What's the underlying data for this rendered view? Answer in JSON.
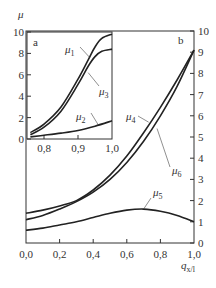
{
  "chart_data": [
    {
      "id": "b",
      "type": "line",
      "panel_label": "b",
      "xlabel": "q_{x/l}",
      "xlabel_main": "q",
      "xlabel_sub": "x/l",
      "ylabel": "",
      "xlim": [
        0.0,
        1.0
      ],
      "ylim": [
        0,
        10
      ],
      "x_ticks": [
        0.0,
        0.2,
        0.4,
        0.6,
        0.8,
        1.0
      ],
      "x_tick_labels": [
        "0,0",
        "0,2",
        "0,4",
        "0,6",
        "0,8",
        "1,0"
      ],
      "y_ticks": [
        0,
        1,
        2,
        3,
        4,
        5,
        6,
        7,
        8,
        9,
        10
      ],
      "y_tick_labels": [
        "0",
        "1",
        "2",
        "3",
        "4",
        "5",
        "6",
        "7",
        "8",
        "9",
        "10"
      ],
      "y_axis_side": "right",
      "series": [
        {
          "name": "μ4",
          "label_main": "μ",
          "label_sub": "4",
          "x": [
            0.0,
            0.1,
            0.2,
            0.3,
            0.4,
            0.5,
            0.6,
            0.7,
            0.8,
            0.9,
            1.0
          ],
          "y": [
            1.4,
            1.55,
            1.75,
            2.0,
            2.5,
            3.2,
            4.1,
            5.2,
            6.4,
            7.7,
            9.1
          ]
        },
        {
          "name": "μ6",
          "label_main": "μ",
          "label_sub": "6",
          "x": [
            0.0,
            0.1,
            0.2,
            0.3,
            0.4,
            0.5,
            0.6,
            0.7,
            0.8,
            0.9,
            1.0
          ],
          "y": [
            1.1,
            1.3,
            1.6,
            1.95,
            2.4,
            3.0,
            3.8,
            4.8,
            6.0,
            7.4,
            9.1
          ]
        },
        {
          "name": "μ5",
          "label_main": "μ",
          "label_sub": "5",
          "x": [
            0.0,
            0.1,
            0.2,
            0.3,
            0.4,
            0.5,
            0.6,
            0.7,
            0.8,
            0.9,
            1.0
          ],
          "y": [
            0.6,
            0.7,
            0.85,
            1.0,
            1.2,
            1.4,
            1.55,
            1.6,
            1.5,
            1.3,
            1.0
          ]
        }
      ]
    },
    {
      "id": "a",
      "type": "line",
      "panel_label": "a",
      "xlabel": "",
      "ylabel": "μ",
      "xlim": [
        0.75,
        1.0
      ],
      "ylim": [
        0,
        10
      ],
      "x_ticks": [
        0.8,
        0.9,
        1.0
      ],
      "x_tick_labels": [
        "0,8",
        "0,9",
        "1,0"
      ],
      "y_ticks": [
        0,
        2,
        4,
        6,
        8,
        10
      ],
      "y_tick_labels": [
        "0",
        "2",
        "4",
        "6",
        "8",
        "10"
      ],
      "y_axis_side": "left",
      "series": [
        {
          "name": "μ1",
          "label_main": "μ",
          "label_sub": "1",
          "x": [
            0.76,
            0.8,
            0.85,
            0.9,
            0.93,
            0.95,
            0.97,
            1.0
          ],
          "y": [
            0.6,
            1.4,
            3.0,
            5.6,
            7.4,
            8.6,
            9.4,
            9.8
          ]
        },
        {
          "name": "μ3",
          "label_main": "μ",
          "label_sub": "3",
          "x": [
            0.76,
            0.8,
            0.85,
            0.9,
            0.93,
            0.95,
            0.97,
            1.0
          ],
          "y": [
            0.4,
            1.1,
            2.6,
            5.1,
            6.8,
            7.7,
            8.2,
            8.4
          ]
        },
        {
          "name": "μ2",
          "label_main": "μ",
          "label_sub": "2",
          "x": [
            0.76,
            0.8,
            0.85,
            0.9,
            0.95,
            1.0
          ],
          "y": [
            0.2,
            0.35,
            0.55,
            0.8,
            1.2,
            1.7
          ]
        }
      ]
    }
  ]
}
